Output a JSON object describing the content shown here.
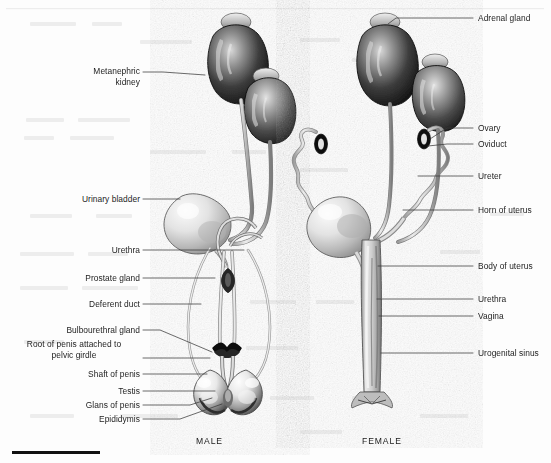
{
  "figure": {
    "captions": [
      {
        "text": "MALE",
        "x": 196,
        "y": 436
      },
      {
        "text": "FEMALE",
        "x": 362,
        "y": 436
      }
    ]
  },
  "male_labels": [
    {
      "id": "metanephric-kidney",
      "lines": [
        "Metanephric",
        "kidney"
      ],
      "align": "right",
      "x": 36,
      "y": 66,
      "w": 104,
      "leader": [
        [
          143,
          72
        ],
        [
          163,
          72
        ],
        [
          205,
          75
        ]
      ]
    },
    {
      "id": "urinary-bladder",
      "lines": [
        "Urinary bladder"
      ],
      "align": "right",
      "x": 36,
      "y": 194,
      "w": 104,
      "leader": [
        [
          143,
          199
        ],
        [
          180,
          199
        ]
      ]
    },
    {
      "id": "urethra",
      "lines": [
        "Urethra"
      ],
      "align": "right",
      "x": 36,
      "y": 245,
      "w": 104,
      "leader": [
        [
          143,
          250
        ],
        [
          244,
          250
        ]
      ]
    },
    {
      "id": "prostate-gland",
      "lines": [
        "Prostate gland"
      ],
      "align": "right",
      "x": 36,
      "y": 273,
      "w": 104,
      "leader": [
        [
          143,
          278
        ],
        [
          215,
          278
        ]
      ]
    },
    {
      "id": "deferent-duct",
      "lines": [
        "Deferent duct"
      ],
      "align": "right",
      "x": 36,
      "y": 299,
      "w": 104,
      "leader": [
        [
          143,
          304
        ],
        [
          201,
          304
        ]
      ]
    },
    {
      "id": "bulbourethral-gland",
      "lines": [
        "Bulbourethral gland"
      ],
      "align": "right",
      "x": 10,
      "y": 325,
      "w": 130,
      "leader": [
        [
          143,
          330
        ],
        [
          160,
          330
        ],
        [
          212,
          352
        ]
      ]
    },
    {
      "id": "root-of-penis",
      "lines": [
        "Root of penis attached to",
        "pelvic  girdle"
      ],
      "align": "center",
      "x": 8,
      "y": 339,
      "w": 132,
      "leader": [
        [
          143,
          358
        ],
        [
          210,
          358
        ]
      ]
    },
    {
      "id": "shaft-of-penis",
      "lines": [
        "Shaft of penis"
      ],
      "align": "right",
      "x": 36,
      "y": 369,
      "w": 104,
      "leader": [
        [
          143,
          374
        ],
        [
          207,
          374
        ]
      ]
    },
    {
      "id": "testis",
      "lines": [
        "Testis"
      ],
      "align": "right",
      "x": 36,
      "y": 386,
      "w": 104,
      "leader": [
        [
          143,
          391
        ],
        [
          215,
          391
        ]
      ]
    },
    {
      "id": "glans-of-penis",
      "lines": [
        "Glans of penis"
      ],
      "align": "right",
      "x": 36,
      "y": 400,
      "w": 104,
      "leader": [
        [
          143,
          405
        ],
        [
          190,
          405
        ],
        [
          212,
          398
        ]
      ]
    },
    {
      "id": "epididymis",
      "lines": [
        "Epididymis"
      ],
      "align": "right",
      "x": 36,
      "y": 414,
      "w": 104,
      "leader": [
        [
          143,
          419
        ],
        [
          180,
          419
        ],
        [
          222,
          404
        ]
      ]
    }
  ],
  "female_labels": [
    {
      "id": "adrenal-gland",
      "lines": [
        "Adrenal gland"
      ],
      "align": "left",
      "x": 478,
      "y": 13,
      "leader": [
        [
          473,
          18
        ],
        [
          396,
          18
        ],
        [
          388,
          24
        ]
      ]
    },
    {
      "id": "ovary",
      "lines": [
        "Ovary"
      ],
      "align": "left",
      "x": 478,
      "y": 123,
      "leader": [
        [
          473,
          128
        ],
        [
          447,
          128
        ],
        [
          430,
          139
        ]
      ]
    },
    {
      "id": "oviduct",
      "lines": [
        "Oviduct"
      ],
      "align": "left",
      "x": 478,
      "y": 139,
      "leader": [
        [
          473,
          144
        ],
        [
          447,
          144
        ],
        [
          428,
          146
        ]
      ]
    },
    {
      "id": "ureter",
      "lines": [
        "Ureter"
      ],
      "align": "left",
      "x": 478,
      "y": 171,
      "leader": [
        [
          473,
          176
        ],
        [
          418,
          176
        ]
      ]
    },
    {
      "id": "horn-of-uterus",
      "lines": [
        "Horn of uterus"
      ],
      "align": "left",
      "x": 478,
      "y": 205,
      "leader": [
        [
          473,
          210
        ],
        [
          403,
          210
        ]
      ]
    },
    {
      "id": "body-of-uterus",
      "lines": [
        "Body of uterus"
      ],
      "align": "left",
      "x": 478,
      "y": 261,
      "leader": [
        [
          473,
          266
        ],
        [
          378,
          266
        ]
      ]
    },
    {
      "id": "urethra-f",
      "lines": [
        "Urethra"
      ],
      "align": "left",
      "x": 478,
      "y": 294,
      "leader": [
        [
          473,
          299
        ],
        [
          377,
          299
        ]
      ]
    },
    {
      "id": "vagina",
      "lines": [
        "Vagina"
      ],
      "align": "left",
      "x": 478,
      "y": 311,
      "leader": [
        [
          473,
          316
        ],
        [
          379,
          316
        ]
      ]
    },
    {
      "id": "urogenital-sinus",
      "lines": [
        "Urogenital sinus"
      ],
      "align": "left",
      "x": 478,
      "y": 348,
      "leader": [
        [
          473,
          353
        ],
        [
          381,
          353
        ]
      ]
    }
  ],
  "rule": {
    "x": 12,
    "y": 451,
    "width": 88,
    "height": 3,
    "color": "#111111"
  },
  "colors": {
    "ink": "#1d1d1d",
    "leader": "#3a3a3a",
    "background": "#fdfdfd",
    "organ_dark": "#1a1a1a",
    "organ_mid": "#8a8a8a",
    "organ_light": "#e6e6e6"
  }
}
